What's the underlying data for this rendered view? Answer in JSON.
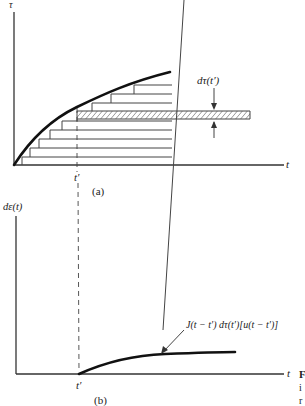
{
  "figure": {
    "panel_a": {
      "y_axis_label": "τ",
      "x_axis_label": "t",
      "tick_label": "t′",
      "increment_label": "dτ(t′)",
      "caption": "(a)"
    },
    "panel_b": {
      "y_axis_label": "dε(t)",
      "x_axis_label": "t",
      "tick_label": "t′",
      "curve_annotation": "J(t − t′) dτ(t′)[u(t − t′)]",
      "caption": "(b)"
    },
    "side_text": [
      "F",
      "i",
      "r"
    ]
  }
}
